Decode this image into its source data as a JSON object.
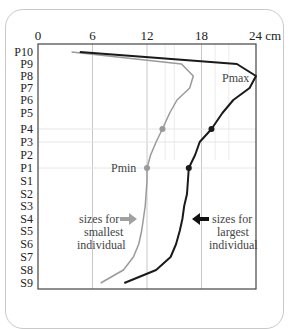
{
  "chart_data": {
    "type": "line",
    "orientation": "horizontal-values-vertical-categories",
    "title": "",
    "xlabel": "cm",
    "ylabel": "",
    "x_axis_position": "top",
    "xlim": [
      0,
      24
    ],
    "x_ticks": [
      "0",
      "6",
      "12",
      "18",
      "24 cm"
    ],
    "x_tick_values": [
      0,
      6,
      12,
      18,
      24
    ],
    "categories": [
      "P10",
      "P9",
      "P8",
      "P7",
      "P6",
      "P5",
      "P4",
      "P3",
      "P2",
      "P1",
      "S1",
      "S2",
      "S3",
      "S4",
      "S5",
      "S6",
      "S7",
      "S8",
      "S9"
    ],
    "grid": true,
    "series": [
      {
        "name": "sizes for smallest individual",
        "color": "#9a9a9a",
        "values": [
          3.7,
          15.8,
          17.1,
          16.7,
          15.3,
          14.5,
          13.7,
          13.0,
          12.4,
          12.0,
          12.0,
          11.9,
          11.8,
          11.6,
          11.4,
          11.1,
          10.5,
          9.4,
          6.9
        ],
        "markers": [
          {
            "category": "P4",
            "value": 13.7
          },
          {
            "category": "P1",
            "value": 12.0,
            "label": "Pmin"
          }
        ]
      },
      {
        "name": "sizes for largest individual",
        "color": "#1a1a1a",
        "values": [
          4.6,
          21.9,
          24.0,
          23.3,
          21.5,
          20.3,
          19.1,
          17.8,
          17.3,
          16.6,
          16.5,
          16.4,
          16.1,
          15.9,
          15.6,
          15.2,
          14.6,
          13.0,
          9.5
        ],
        "markers": [
          {
            "category": "P4",
            "value": 19.1
          },
          {
            "category": "P1",
            "value": 16.6
          }
        ],
        "peak_label": {
          "category": "P8",
          "text": "Pmax"
        }
      }
    ],
    "annotations": [
      {
        "text": "Pmax",
        "near": "largest series peak at P8"
      },
      {
        "text": "Pmin",
        "near": "smallest series at P1"
      },
      {
        "text": "sizes for smallest individual",
        "arrow": "gray, pointing right",
        "row": "S4"
      },
      {
        "text": "sizes for largest individual",
        "arrow": "black, pointing left",
        "row": "S4"
      }
    ]
  },
  "labels": {
    "pmax": "Pmax",
    "pmin": "Pmin",
    "small_1": "sizes for",
    "small_2": "smallest",
    "small_3": "individual",
    "large_1": "sizes for",
    "large_2": "largest",
    "large_3": "individual"
  }
}
